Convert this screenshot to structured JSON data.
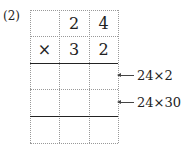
{
  "problem_label": "(2)",
  "grid": {
    "rows": [
      [
        "",
        "2",
        "4"
      ],
      [
        "×",
        "3",
        "2"
      ],
      [
        "",
        "",
        ""
      ],
      [
        "",
        "",
        ""
      ],
      [
        "",
        "",
        ""
      ]
    ]
  },
  "annotations": [
    {
      "text": "24×2"
    },
    {
      "text": "24×30"
    }
  ]
}
